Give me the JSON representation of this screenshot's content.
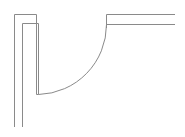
{
  "diagram": {
    "type": "architectural-door-symbol",
    "stroke_color": "#8a8a8a",
    "background": "#ffffff",
    "left_wall": {
      "outer_line": {
        "x": 14.5,
        "y1": 14.5,
        "y2": 127
      },
      "inner_line": {
        "x": 22.5,
        "y1": 23.5,
        "y2": 127
      }
    },
    "door_leaf": {
      "jamb_top_outer": {
        "x1": 14.5,
        "x2": 36.5,
        "y": 14.5
      },
      "jamb_top_inner": {
        "x1": 22.5,
        "x2": 38.5,
        "y": 23.5
      },
      "leaf_left": {
        "x": 36.5,
        "y1": 14.5,
        "y2": 94.5
      },
      "leaf_right": {
        "x": 38.5,
        "y1": 23.5,
        "y2": 94.5
      },
      "leaf_bottom": {
        "x1": 36.5,
        "x2": 38.5,
        "y": 94.5
      }
    },
    "swing_arc": {
      "start": [
        38.5,
        94.5
      ],
      "end": [
        106.5,
        24.5
      ],
      "radius": 70
    },
    "right_wall": {
      "top_line": {
        "x1": 106.5,
        "x2": 175,
        "y": 14.5
      },
      "bottom_line": {
        "x1": 106.5,
        "x2": 175,
        "y": 24.5
      },
      "end_cap": {
        "x": 106.5,
        "y1": 14.5,
        "y2": 24.5
      }
    }
  }
}
